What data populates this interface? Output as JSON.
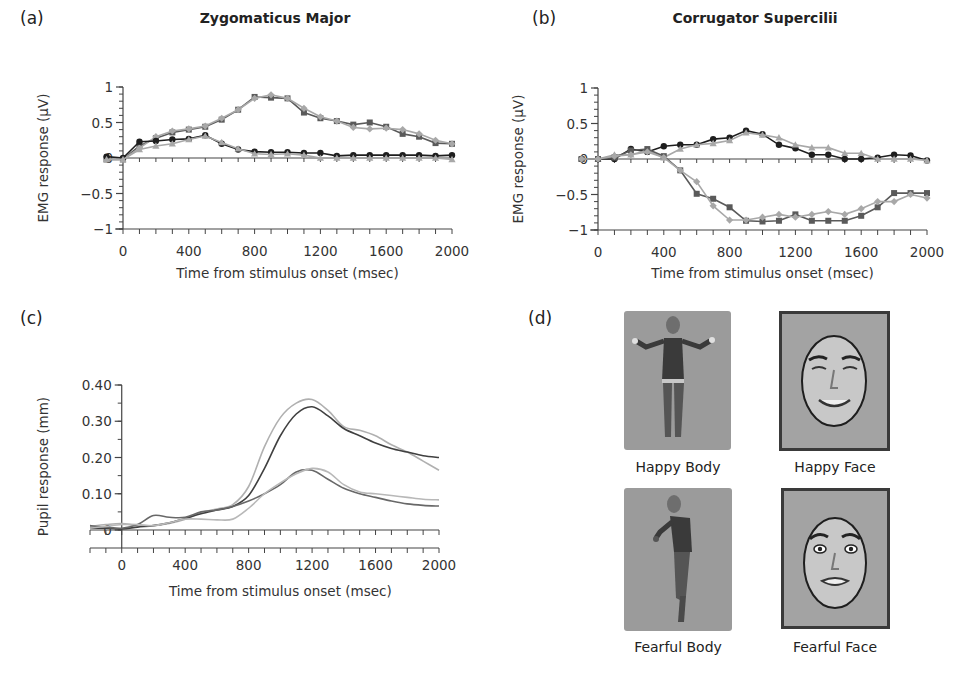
{
  "panels": {
    "a": {
      "label": "(a)",
      "title": "Zygomaticus Major"
    },
    "b": {
      "label": "(b)",
      "title": "Corrugator Supercilii"
    },
    "c": {
      "label": "(c)",
      "title": ""
    },
    "d": {
      "label": "(d)"
    }
  },
  "stimuli": [
    {
      "id": "happy-body",
      "caption": "Happy Body",
      "kind": "body",
      "expression": "happy"
    },
    {
      "id": "happy-face",
      "caption": "Happy Face",
      "kind": "face",
      "expression": "happy"
    },
    {
      "id": "fearful-body",
      "caption": "Fearful Body",
      "kind": "body",
      "expression": "fearful"
    },
    {
      "id": "fearful-face",
      "caption": "Fearful Face",
      "kind": "face",
      "expression": "fearful"
    }
  ],
  "colors": {
    "dark": "#1e1e1e",
    "mid": "#5a5a5a",
    "light": "#a8a8a8",
    "axis": "#444444",
    "stim_bg": "#9b9b9b"
  },
  "chart_data": [
    {
      "id": "a",
      "type": "line",
      "title": "Zygomaticus Major",
      "xlabel": "Time from stimulus onset (msec)",
      "ylabel": "EMG response (µV)",
      "xlim": [
        0,
        2000
      ],
      "ylim": [
        -1,
        1
      ],
      "xticks": [
        0,
        400,
        800,
        1200,
        1600,
        2000
      ],
      "yticks": [
        1,
        0.5,
        0,
        -0.5,
        -1
      ],
      "ytick_labels": [
        "1",
        "0.5",
        "0",
        "−0.5",
        "−1"
      ],
      "minor_x_step": 100,
      "minor_y_step": 0.1,
      "grid": false,
      "legend": null,
      "x": [
        -100,
        0,
        100,
        200,
        300,
        400,
        500,
        600,
        700,
        800,
        900,
        1000,
        1100,
        1200,
        1300,
        1400,
        1500,
        1600,
        1700,
        1800,
        1900,
        2000
      ],
      "series": [
        {
          "name": "series-square-dark-gray",
          "marker": "square",
          "color": "#5a5a5a",
          "values": [
            -0.02,
            -0.02,
            0.17,
            0.28,
            0.36,
            0.4,
            0.44,
            0.54,
            0.68,
            0.86,
            0.85,
            0.84,
            0.64,
            0.56,
            0.52,
            0.47,
            0.5,
            0.44,
            0.34,
            0.3,
            0.21,
            0.2
          ]
        },
        {
          "name": "series-diamond-light-gray",
          "marker": "diamond",
          "color": "#a8a8a8",
          "values": [
            -0.02,
            -0.02,
            0.14,
            0.3,
            0.38,
            0.41,
            0.45,
            0.56,
            0.68,
            0.84,
            0.89,
            0.84,
            0.7,
            0.58,
            0.52,
            0.43,
            0.41,
            0.42,
            0.4,
            0.34,
            0.25,
            0.2
          ]
        },
        {
          "name": "series-circle-black",
          "marker": "circle",
          "color": "#1e1e1e",
          "values": [
            0.02,
            0.0,
            0.23,
            0.24,
            0.26,
            0.27,
            0.32,
            0.2,
            0.12,
            0.09,
            0.08,
            0.08,
            0.07,
            0.07,
            0.03,
            0.04,
            0.04,
            0.04,
            0.04,
            0.04,
            0.03,
            0.04
          ]
        },
        {
          "name": "series-triangle-light-gray",
          "marker": "triangle",
          "color": "#a8a8a8",
          "values": [
            -0.02,
            -0.02,
            0.12,
            0.17,
            0.2,
            0.26,
            0.31,
            0.22,
            0.13,
            0.06,
            0.05,
            0.06,
            0.04,
            0.0,
            0.0,
            0.0,
            0.0,
            0.0,
            0.0,
            0.0,
            0.0,
            -0.02
          ]
        }
      ]
    },
    {
      "id": "b",
      "type": "line",
      "title": "Corrugator Supercilii",
      "xlabel": "Time from stimulus onset (msec)",
      "ylabel": "EMG response (µV)",
      "xlim": [
        0,
        2000
      ],
      "ylim": [
        -1,
        1
      ],
      "xticks": [
        0,
        400,
        800,
        1200,
        1600,
        2000
      ],
      "yticks": [
        1,
        0.5,
        0,
        -0.5,
        -1
      ],
      "ytick_labels": [
        "1",
        "0.5",
        "0",
        "−0.5",
        "−1"
      ],
      "minor_x_step": 100,
      "minor_y_step": 0.1,
      "grid": false,
      "legend": null,
      "x": [
        -100,
        0,
        100,
        200,
        300,
        400,
        500,
        600,
        700,
        800,
        900,
        1000,
        1100,
        1200,
        1300,
        1400,
        1500,
        1600,
        1700,
        1800,
        1900,
        2000
      ],
      "series": [
        {
          "name": "series-circle-black",
          "marker": "circle",
          "color": "#1e1e1e",
          "values": [
            0.0,
            0.0,
            0.0,
            0.14,
            0.1,
            0.18,
            0.2,
            0.2,
            0.28,
            0.3,
            0.4,
            0.35,
            0.2,
            0.15,
            0.06,
            0.06,
            0.0,
            0.0,
            0.02,
            0.06,
            0.05,
            -0.02
          ]
        },
        {
          "name": "series-triangle-light-gray",
          "marker": "triangle",
          "color": "#a8a8a8",
          "values": [
            0.0,
            0.0,
            0.06,
            0.06,
            0.12,
            0.02,
            0.14,
            0.2,
            0.22,
            0.26,
            0.37,
            0.34,
            0.3,
            0.2,
            0.16,
            0.16,
            0.08,
            0.08,
            0.0,
            0.0,
            0.0,
            -0.02
          ]
        },
        {
          "name": "series-square-dark-gray",
          "marker": "square",
          "color": "#5a5a5a",
          "values": [
            0.0,
            0.0,
            0.02,
            0.12,
            0.14,
            0.04,
            -0.16,
            -0.49,
            -0.56,
            -0.68,
            -0.87,
            -0.88,
            -0.87,
            -0.78,
            -0.87,
            -0.87,
            -0.87,
            -0.8,
            -0.68,
            -0.48,
            -0.48,
            -0.48
          ]
        },
        {
          "name": "series-diamond-light-gray",
          "marker": "diamond",
          "color": "#a8a8a8",
          "values": [
            0.0,
            0.0,
            0.04,
            0.06,
            0.1,
            0.02,
            -0.16,
            -0.32,
            -0.66,
            -0.86,
            -0.86,
            -0.82,
            -0.78,
            -0.82,
            -0.78,
            -0.74,
            -0.78,
            -0.7,
            -0.6,
            -0.6,
            -0.5,
            -0.55
          ]
        }
      ]
    },
    {
      "id": "c",
      "type": "line",
      "title": "",
      "xlabel": "Time from stimulus onset (msec)",
      "ylabel": "Pupil response (mm)",
      "xlim": [
        -200,
        2000
      ],
      "ylim": [
        0,
        0.4
      ],
      "xticks": [
        0,
        400,
        800,
        1200,
        1600,
        2000
      ],
      "yticks": [
        0.4,
        0.3,
        0.2,
        0.1,
        0
      ],
      "ytick_labels": [
        "0.40",
        "0.30",
        "0.20",
        "0.10",
        "0"
      ],
      "minor_x_step": 100,
      "minor_y_step": 0.05,
      "grid": false,
      "legend": null,
      "smooth": true,
      "x": [
        -200,
        -100,
        0,
        100,
        200,
        300,
        400,
        500,
        600,
        700,
        800,
        900,
        1000,
        1100,
        1200,
        1300,
        1400,
        1500,
        1600,
        1700,
        1800,
        1900,
        2000
      ],
      "series": [
        {
          "name": "curve-light-upper",
          "color": "#b0b0b0",
          "values": [
            0.01,
            0.015,
            0.018,
            0.012,
            0.012,
            0.018,
            0.03,
            0.048,
            0.058,
            0.07,
            0.12,
            0.23,
            0.31,
            0.35,
            0.36,
            0.33,
            0.285,
            0.275,
            0.26,
            0.235,
            0.215,
            0.19,
            0.165
          ]
        },
        {
          "name": "curve-dark-upper",
          "color": "#404040",
          "values": [
            0.005,
            0.005,
            0.003,
            0.008,
            0.012,
            0.02,
            0.032,
            0.045,
            0.055,
            0.065,
            0.095,
            0.17,
            0.26,
            0.32,
            0.34,
            0.315,
            0.28,
            0.26,
            0.24,
            0.225,
            0.215,
            0.205,
            0.2
          ]
        },
        {
          "name": "curve-mid-lower",
          "color": "#686868",
          "values": [
            0.012,
            0.008,
            0.005,
            0.015,
            0.04,
            0.035,
            0.035,
            0.05,
            0.055,
            0.065,
            0.08,
            0.1,
            0.125,
            0.16,
            0.165,
            0.14,
            0.115,
            0.1,
            0.09,
            0.08,
            0.072,
            0.068,
            0.066
          ]
        },
        {
          "name": "curve-light-lower",
          "color": "#b8b8b8",
          "values": [
            0.005,
            0.01,
            0.015,
            0.015,
            0.012,
            0.02,
            0.03,
            0.03,
            0.028,
            0.03,
            0.06,
            0.1,
            0.13,
            0.155,
            0.17,
            0.16,
            0.125,
            0.105,
            0.1,
            0.095,
            0.09,
            0.085,
            0.083
          ]
        }
      ]
    }
  ]
}
